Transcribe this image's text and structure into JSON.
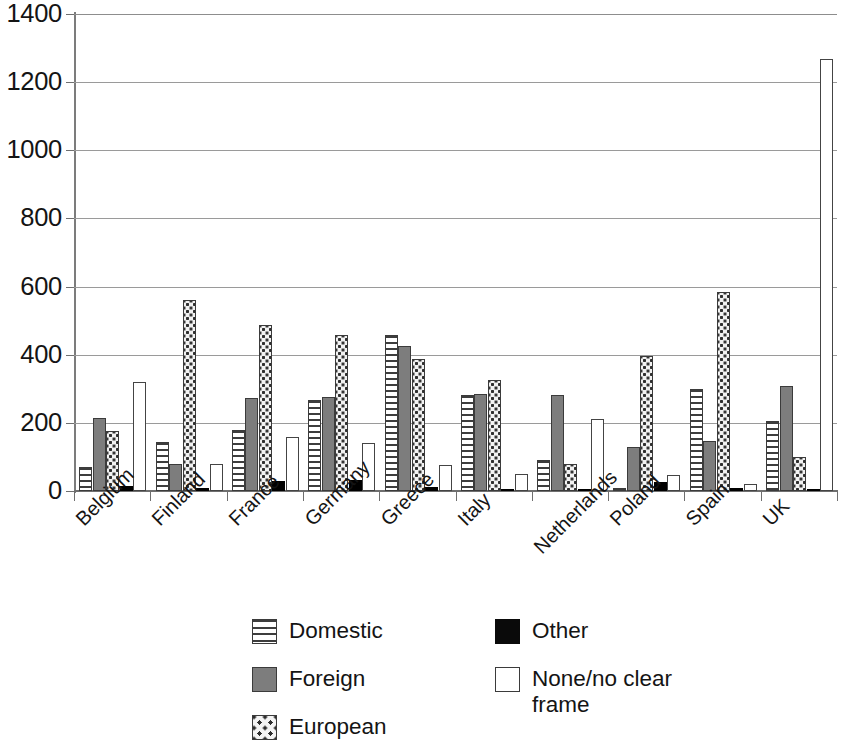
{
  "chart_data": {
    "type": "bar",
    "title": "",
    "subtitle": "",
    "xlabel": "",
    "ylabel": "",
    "ylim": [
      0,
      1400
    ],
    "ytick_step": 200,
    "yticks": [
      "1400",
      "1200",
      "1000",
      "800",
      "600",
      "400",
      "200",
      "0"
    ],
    "grid": true,
    "grid_axis": "y",
    "legend_position": "bottom",
    "categories": [
      "Belgium",
      "Finland",
      "France",
      "Germany",
      "Greece",
      "Italy",
      "Netherlands",
      "Poland",
      "Spain",
      "UK"
    ],
    "series": [
      {
        "name": "Domestic",
        "pattern": "horizontal-stripes",
        "color": "#ffffff",
        "values": [
          70,
          143,
          180,
          268,
          458,
          282,
          90,
          10,
          298,
          205
        ]
      },
      {
        "name": "Foreign",
        "pattern": "solid-gray",
        "color": "#7d7d7d",
        "values": [
          215,
          78,
          272,
          275,
          425,
          285,
          282,
          130,
          148,
          307
        ]
      },
      {
        "name": "European",
        "pattern": "checkered-dots",
        "color": "#f2f2f2",
        "values": [
          175,
          560,
          488,
          458,
          388,
          325,
          78,
          397,
          583,
          100
        ]
      },
      {
        "name": "Other",
        "pattern": "solid-black",
        "color": "#000000",
        "values": [
          15,
          8,
          30,
          32,
          12,
          2,
          5,
          25,
          8,
          3
        ]
      },
      {
        "name": "None/no clear frame",
        "pattern": "hollow-white",
        "color": "#ffffff",
        "values": [
          320,
          80,
          160,
          140,
          75,
          50,
          210,
          48,
          22,
          1268
        ]
      }
    ]
  },
  "legend": {
    "items": [
      {
        "label": "Domestic",
        "swatch": "domestic"
      },
      {
        "label": "Foreign",
        "swatch": "foreign"
      },
      {
        "label": "European",
        "swatch": "european"
      },
      {
        "label": "Other",
        "swatch": "other"
      },
      {
        "label": "None/no clear frame",
        "swatch": "none"
      }
    ]
  }
}
